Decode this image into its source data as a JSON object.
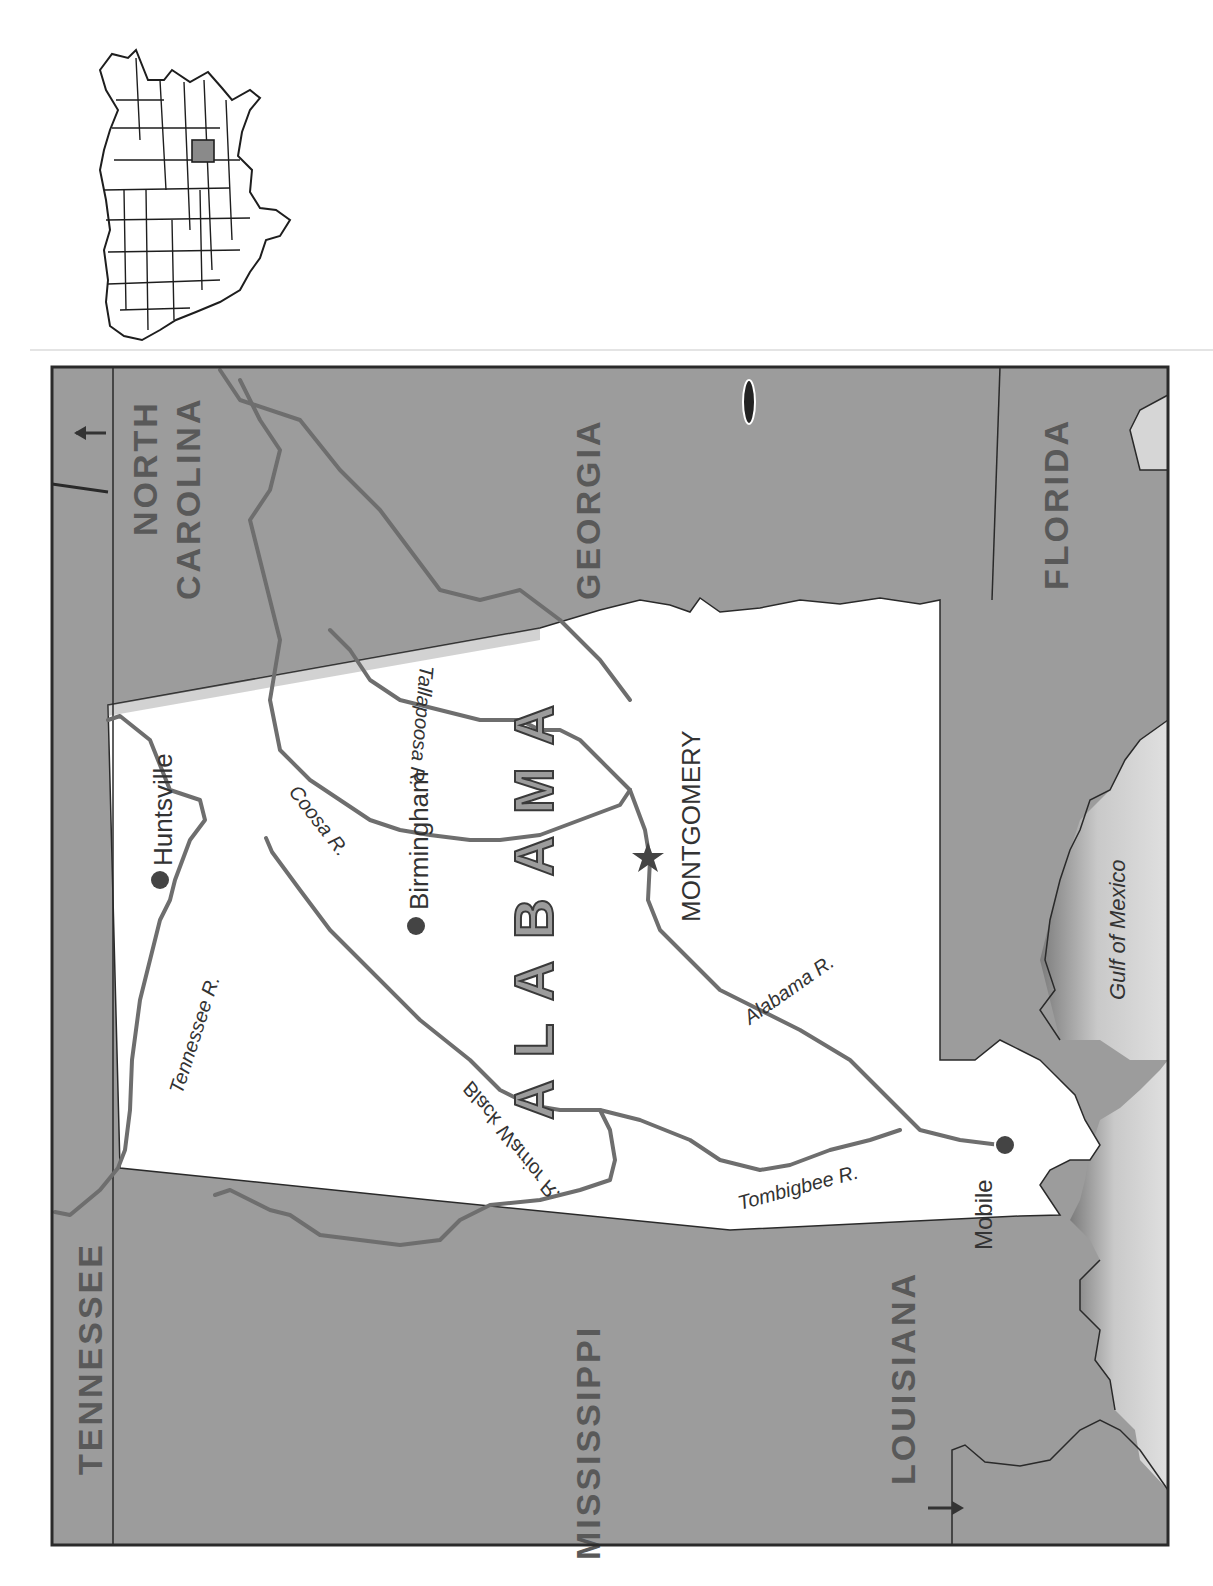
{
  "title": "Alabama",
  "inset": {
    "label": "United States locator map",
    "highlighted_state": "Alabama"
  },
  "state": {
    "name": "ALABAMA"
  },
  "neighbors": {
    "tennessee": "TENNESSEE",
    "north_carolina_line1": "NORTH",
    "north_carolina_line2": "CAROLINA",
    "georgia": "GEORGIA",
    "florida": "FLORIDA",
    "mississippi": "MISSISSIPPI",
    "louisiana": "LOUISIANA"
  },
  "water": {
    "gulf": "Gulf of Mexico"
  },
  "cities": {
    "capital": "MONTGOMERY",
    "huntsville": "Huntsville",
    "birmingham": "Birmingham",
    "mobile": "Mobile"
  },
  "rivers": {
    "tennessee": "Tennessee R.",
    "black_warrior": "Black Warrior R.",
    "coosa": "Coosa R.",
    "tallapoosa": "Tallapoosa R.",
    "alabama": "Alabama R.",
    "tombigbee": "Tombigbee R."
  },
  "colors": {
    "neighbor_fill": "#9c9c9c",
    "state_fill": "#ffffff",
    "gulf_fill": "#d6d6d6",
    "river": "#6e6e6e",
    "border": "#2a2a2a",
    "label_text": "#595959",
    "inset_highlight": "#8a8a8a"
  }
}
